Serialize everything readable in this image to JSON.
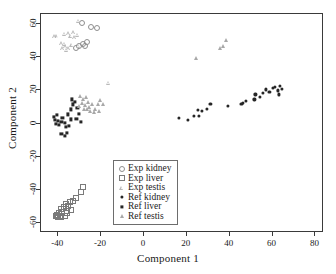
{
  "chart": {
    "type": "scatter",
    "title": "",
    "xlabel": "Component 1",
    "ylabel": "Component 2",
    "xlim": [
      -48,
      84
    ],
    "ylim": [
      -66,
      66
    ],
    "xticks": [
      "-40",
      "-20",
      "0",
      "20",
      "40",
      "60",
      "80"
    ],
    "xtickvals": [
      -40,
      -20,
      0,
      20,
      40,
      60,
      80
    ],
    "yticks": [
      "-60",
      "-40",
      "-20",
      "0",
      "20",
      "40",
      "60"
    ],
    "ytickvals": [
      -60,
      -40,
      -20,
      0,
      20,
      40,
      60
    ],
    "grid": false,
    "legend_position": "center",
    "colors": {
      "exp_kidney": "#8e8e8e",
      "exp_liver": "#7a7a7a",
      "exp_testis": "#b9b9b9",
      "ref_kidney": "#262626",
      "ref_liver": "#262626",
      "ref_testis": "#a8a8a8",
      "frame": "#3a3a3a",
      "background": "#ffffff"
    }
  },
  "legend": {
    "items": [
      {
        "label": "Exp kidney",
        "marker": "circle-open",
        "icon": "open-circle-marker-icon"
      },
      {
        "label": "Exp liver",
        "marker": "square-open",
        "icon": "open-square-marker-icon"
      },
      {
        "label": "Exp testis",
        "marker": "triangle-open",
        "icon": "open-triangle-marker-icon"
      },
      {
        "label": "Ref kidney",
        "marker": "circle-fill",
        "icon": "filled-circle-marker-icon"
      },
      {
        "label": "Ref liver",
        "marker": "square-fill",
        "icon": "filled-square-marker-icon"
      },
      {
        "label": "Ref testis",
        "marker": "triangle-fill",
        "icon": "filled-triangle-marker-icon"
      }
    ]
  },
  "chart_data": {
    "type": "scatter",
    "title": "",
    "xlabel": "Component 1",
    "ylabel": "Component 2",
    "xlim": [
      -48,
      84
    ],
    "ylim": [
      -66,
      66
    ],
    "xticks": [
      -40,
      -20,
      0,
      20,
      40,
      60,
      80
    ],
    "yticks": [
      -60,
      -40,
      -20,
      0,
      20,
      40,
      60
    ],
    "grid": false,
    "legend_position": "center",
    "series": [
      {
        "name": "Exp kidney",
        "marker": "circle-open",
        "color": "#8e8e8e",
        "points": [
          [
            -29.0,
            60.5
          ],
          [
            -24.5,
            58.0
          ],
          [
            -22.0,
            57.5
          ],
          [
            -26.5,
            49.0
          ],
          [
            -28.5,
            48.0
          ],
          [
            -30.5,
            47.0
          ],
          [
            -31.5,
            45.5
          ],
          [
            -27.5,
            46.5
          ]
        ]
      },
      {
        "name": "Exp liver",
        "marker": "square-open",
        "color": "#7a7a7a",
        "points": [
          [
            -28.5,
            -38.5
          ],
          [
            -29.5,
            -41.5
          ],
          [
            -31.5,
            -45.0
          ],
          [
            -33.0,
            -46.5
          ],
          [
            -34.5,
            -47.5
          ],
          [
            -36.5,
            -48.5
          ],
          [
            -35.5,
            -50.0
          ],
          [
            -37.5,
            -50.5
          ],
          [
            -38.5,
            -51.5
          ],
          [
            -36.0,
            -52.5
          ],
          [
            -38.0,
            -53.5
          ],
          [
            -39.5,
            -54.0
          ],
          [
            -40.5,
            -55.0
          ],
          [
            -39.0,
            -55.5
          ],
          [
            -41.0,
            -56.0
          ],
          [
            -40.0,
            -56.5
          ],
          [
            -38.5,
            -56.5
          ],
          [
            -37.0,
            -55.5
          ],
          [
            -36.0,
            -54.0
          ],
          [
            -34.0,
            -52.0
          ]
        ]
      },
      {
        "name": "Exp testis",
        "marker": "triangle-open",
        "color": "#b9b9b9",
        "points": [
          [
            -30.5,
            62.0
          ],
          [
            -33.0,
            55.0
          ],
          [
            -35.0,
            54.5
          ],
          [
            -37.0,
            54.0
          ],
          [
            -40.5,
            52.5
          ],
          [
            -41.5,
            52.5
          ],
          [
            -34.0,
            53.0
          ],
          [
            -32.5,
            52.0
          ],
          [
            -31.0,
            53.5
          ],
          [
            -38.5,
            48.5
          ],
          [
            -37.0,
            48.0
          ],
          [
            -36.5,
            46.5
          ],
          [
            -35.0,
            45.5
          ],
          [
            -33.5,
            47.5
          ],
          [
            -30.5,
            47.0
          ],
          [
            -38.0,
            45.5
          ],
          [
            -36.0,
            44.5
          ],
          [
            -16.5,
            24.5
          ]
        ]
      },
      {
        "name": "Ref kidney",
        "marker": "circle-fill",
        "color": "#262626",
        "points": [
          [
            16.5,
            3.5
          ],
          [
            20.5,
            2.0
          ],
          [
            23.5,
            4.5
          ],
          [
            25.5,
            4.5
          ],
          [
            25.0,
            8.0
          ],
          [
            27.0,
            7.5
          ],
          [
            29.5,
            9.0
          ],
          [
            31.0,
            12.0
          ],
          [
            39.0,
            10.5
          ],
          [
            45.5,
            12.0
          ],
          [
            46.0,
            12.5
          ],
          [
            47.5,
            13.5
          ],
          [
            51.5,
            14.5
          ],
          [
            52.0,
            17.5
          ],
          [
            54.0,
            16.0
          ],
          [
            55.5,
            18.5
          ],
          [
            57.0,
            20.5
          ],
          [
            58.5,
            19.0
          ],
          [
            60.0,
            21.5
          ],
          [
            61.0,
            22.0
          ],
          [
            62.5,
            20.0
          ],
          [
            63.5,
            22.5
          ],
          [
            64.5,
            21.0
          ],
          [
            63.0,
            17.5
          ]
        ]
      },
      {
        "name": "Ref liver",
        "marker": "square-fill",
        "color": "#262626",
        "points": [
          [
            -42.0,
            4.0
          ],
          [
            -41.5,
            2.0
          ],
          [
            -40.5,
            5.0
          ],
          [
            -40.0,
            1.5
          ],
          [
            -41.0,
            0.0
          ],
          [
            -39.5,
            -1.0
          ],
          [
            -38.5,
            1.0
          ],
          [
            -38.0,
            3.5
          ],
          [
            -37.0,
            0.5
          ],
          [
            -36.5,
            -2.0
          ],
          [
            -38.5,
            -6.5
          ],
          [
            -37.0,
            -7.5
          ],
          [
            -36.0,
            -5.5
          ],
          [
            -35.0,
            -1.5
          ],
          [
            -34.0,
            2.5
          ],
          [
            -35.5,
            5.5
          ],
          [
            -34.0,
            8.5
          ],
          [
            -33.0,
            11.5
          ],
          [
            -33.5,
            14.5
          ],
          [
            -32.0,
            13.0
          ],
          [
            -31.0,
            9.5
          ],
          [
            -30.5,
            6.0
          ],
          [
            -29.5,
            1.0
          ],
          [
            -31.5,
            3.0
          ]
        ]
      },
      {
        "name": "Ref testis",
        "marker": "triangle-fill",
        "color": "#a8a8a8",
        "points": [
          [
            -30.0,
            16.5
          ],
          [
            -28.5,
            15.0
          ],
          [
            -27.0,
            16.0
          ],
          [
            -26.0,
            13.0
          ],
          [
            -27.5,
            11.0
          ],
          [
            -29.0,
            12.5
          ],
          [
            -30.5,
            10.5
          ],
          [
            -28.0,
            9.0
          ],
          [
            -25.5,
            10.0
          ],
          [
            -24.0,
            12.0
          ],
          [
            -23.0,
            9.0
          ],
          [
            -21.5,
            11.5
          ],
          [
            -20.5,
            14.0
          ],
          [
            -19.0,
            12.0
          ],
          [
            -21.0,
            7.5
          ],
          [
            -23.5,
            7.0
          ],
          [
            -25.0,
            7.5
          ],
          [
            -26.5,
            8.5
          ],
          [
            24.5,
            39.5
          ],
          [
            35.5,
            45.5
          ],
          [
            37.0,
            47.0
          ],
          [
            38.5,
            50.5
          ]
        ]
      }
    ]
  }
}
